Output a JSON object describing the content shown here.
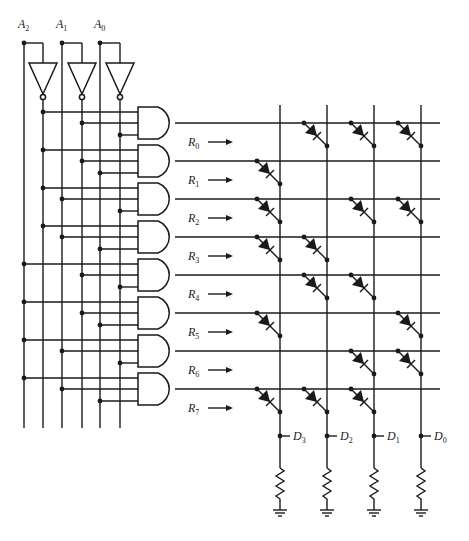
{
  "inputs": [
    {
      "name": "A",
      "sub": "2",
      "x": 24,
      "inv_x": 43
    },
    {
      "name": "A",
      "sub": "1",
      "x": 62,
      "inv_x": 82
    },
    {
      "name": "A",
      "sub": "0",
      "x": 100,
      "inv_x": 120
    }
  ],
  "rows": [
    {
      "label": "R",
      "sub": "0",
      "y": 123,
      "gate_inputs": [
        "A2'",
        "A1'",
        "A0'"
      ],
      "bits": [
        0,
        1,
        1,
        1
      ]
    },
    {
      "label": "R",
      "sub": "1",
      "y": 161,
      "gate_inputs": [
        "A2'",
        "A1'",
        "A0"
      ],
      "bits": [
        1,
        0,
        0,
        0
      ]
    },
    {
      "label": "R",
      "sub": "2",
      "y": 199,
      "gate_inputs": [
        "A2'",
        "A1",
        "A0'"
      ],
      "bits": [
        1,
        0,
        1,
        1
      ]
    },
    {
      "label": "R",
      "sub": "3",
      "y": 237,
      "gate_inputs": [
        "A2'",
        "A1",
        "A0"
      ],
      "bits": [
        1,
        1,
        0,
        0
      ]
    },
    {
      "label": "R",
      "sub": "4",
      "y": 275,
      "gate_inputs": [
        "A2",
        "A1'",
        "A0'"
      ],
      "bits": [
        0,
        1,
        1,
        0
      ]
    },
    {
      "label": "R",
      "sub": "5",
      "y": 313,
      "gate_inputs": [
        "A2",
        "A1'",
        "A0"
      ],
      "bits": [
        1,
        0,
        0,
        1
      ]
    },
    {
      "label": "R",
      "sub": "6",
      "y": 351,
      "gate_inputs": [
        "A2",
        "A1",
        "A0'"
      ],
      "bits": [
        0,
        0,
        1,
        1
      ]
    },
    {
      "label": "R",
      "sub": "7",
      "y": 389,
      "gate_inputs": [
        "A2",
        "A1",
        "A0"
      ],
      "bits": [
        1,
        1,
        1,
        0
      ]
    }
  ],
  "outputs": [
    {
      "label": "D",
      "sub": "3",
      "x": 280
    },
    {
      "label": "D",
      "sub": "2",
      "x": 327
    },
    {
      "label": "D",
      "sub": "1",
      "x": 374
    },
    {
      "label": "D",
      "sub": "0",
      "x": 421
    }
  ],
  "components": {
    "inverter_count": 3,
    "and_gate_count": 8,
    "diode_symbol": "diode",
    "resistor_symbol": "resistor",
    "ground_symbol": "ground"
  }
}
